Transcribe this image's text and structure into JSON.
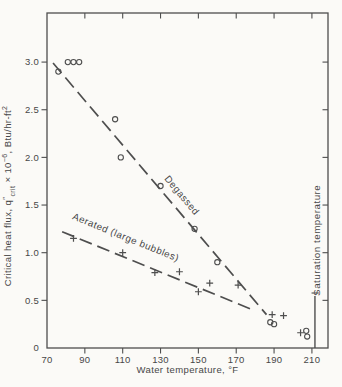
{
  "figure": {
    "background": "#fbfaf7",
    "ink": "#4e4e4e",
    "width": 342,
    "height": 387
  },
  "chart_data": {
    "type": "scatter",
    "title": "",
    "xlabel": "Water temperature, °F",
    "ylabel": "Critical heat flux, q″crit × 10⁻⁶, Btu/hr-ft²",
    "ylabel_segments": [
      {
        "text": "Critical heat flux, q",
        "dy": 0,
        "size": 9.5
      },
      {
        "text": "″",
        "dy": -3.5,
        "size": 8
      },
      {
        "text": "crit",
        "dy": 7,
        "size": 7
      },
      {
        "text": " × 10",
        "dy": -3.5,
        "size": 9.5
      },
      {
        "text": "−6",
        "dy": -4,
        "size": 7
      },
      {
        "text": ", Btu/hr-ft",
        "dy": 4,
        "size": 9.5
      },
      {
        "text": "2",
        "dy": -4,
        "size": 7
      }
    ],
    "xlim": [
      70,
      218.5
    ],
    "ylim": [
      0,
      3.515
    ],
    "grid": false,
    "x_ticks": [
      70,
      90,
      110,
      130,
      150,
      170,
      190,
      210
    ],
    "x_tick_labels": [
      "70",
      "90",
      "110",
      "130",
      "150",
      "170",
      "190",
      "210"
    ],
    "y_ticks": [
      0,
      0.5,
      1.0,
      1.5,
      2.0,
      2.5,
      3.0
    ],
    "y_tick_labels": [
      "0",
      "0.5",
      "1.0",
      "1.5",
      "2.0",
      "2.5",
      "3.0"
    ],
    "series": [
      {
        "name": "Degassed",
        "marker": "circle",
        "points": [
          [
            76,
            2.9
          ],
          [
            81,
            3.0
          ],
          [
            84,
            3.0
          ],
          [
            87,
            3.0
          ],
          [
            106,
            2.4
          ],
          [
            109,
            2.0
          ],
          [
            130,
            1.7
          ],
          [
            148,
            1.25
          ],
          [
            160,
            0.9
          ],
          [
            188,
            0.27
          ],
          [
            190,
            0.25
          ],
          [
            207,
            0.18
          ],
          [
            207.5,
            0.12
          ]
        ],
        "trend_line": {
          "x1": 73.2,
          "y1": 2.99,
          "x2": 186,
          "y2": 0.35
        },
        "label": {
          "text": "Degassed",
          "x": 140,
          "y": 1.58,
          "rotation": 50
        }
      },
      {
        "name": "Aerated (large bubbles)",
        "marker": "plus",
        "points": [
          [
            84,
            1.15
          ],
          [
            110,
            1.0
          ],
          [
            127,
            0.79
          ],
          [
            140,
            0.8
          ],
          [
            150,
            0.59
          ],
          [
            156,
            0.68
          ],
          [
            171,
            0.66
          ],
          [
            189,
            0.35
          ],
          [
            195,
            0.34
          ],
          [
            204,
            0.16
          ]
        ],
        "trend_line": {
          "x1": 78,
          "y1": 1.22,
          "x2": 180,
          "y2": 0.39
        },
        "label": {
          "text": "Aerated (large bubbles)",
          "x": 111,
          "y": 1.13,
          "rotation": 22
        }
      }
    ],
    "annotations": [
      {
        "type": "vline",
        "text": "Saturation temperature",
        "x": 211.6,
        "y_from": 0.0,
        "y_to": 0.545,
        "leader": {
          "y": 0.577,
          "x1": 209.8,
          "x2": 213.6
        },
        "label": {
          "x": 214.5,
          "y": 1.13,
          "rotation": -90
        }
      }
    ]
  }
}
